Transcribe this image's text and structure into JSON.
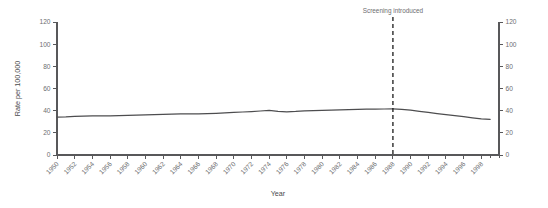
{
  "chart_data": {
    "type": "line",
    "title": "",
    "subtitle": "",
    "xlabel": "Year",
    "ylabel": "Rate per 100,000",
    "ylabel_right": "",
    "xlim": [
      1950,
      2000
    ],
    "ylim": [
      0,
      120
    ],
    "grid": false,
    "legend_position": "none",
    "y_ticks": [
      0,
      20,
      40,
      60,
      80,
      100,
      120
    ],
    "y_ticks_right": [
      0,
      20,
      40,
      60,
      80,
      100,
      120
    ],
    "x_ticks": [
      1950,
      1952,
      1954,
      1956,
      1958,
      1960,
      1962,
      1964,
      1966,
      1968,
      1970,
      1972,
      1974,
      1976,
      1978,
      1980,
      1982,
      1984,
      1986,
      1988,
      1990,
      1992,
      1994,
      1996,
      1998
    ],
    "x_tick_labels": [
      "1950",
      "1952",
      "1954",
      "1956",
      "1958",
      "1960",
      "1962",
      "1964",
      "1966",
      "1968",
      "1970",
      "1972",
      "1974",
      "1976",
      "1978",
      "1980",
      "1982",
      "1984",
      "1986",
      "1988",
      "1990",
      "1992",
      "1994",
      "1996",
      "1998"
    ],
    "annotations": [
      {
        "text": "Screening introduced",
        "x": 1988,
        "type": "vertical-dashed-line",
        "label_position": "top"
      }
    ],
    "series": [
      {
        "name": "Rate per 100,000",
        "color": "#4d4d4f",
        "x": [
          1950,
          1951,
          1952,
          1953,
          1954,
          1955,
          1956,
          1957,
          1958,
          1959,
          1960,
          1961,
          1962,
          1963,
          1964,
          1965,
          1966,
          1967,
          1968,
          1969,
          1970,
          1971,
          1972,
          1973,
          1974,
          1975,
          1976,
          1977,
          1978,
          1979,
          1980,
          1981,
          1982,
          1983,
          1984,
          1985,
          1986,
          1987,
          1988,
          1989,
          1990,
          1991,
          1992,
          1993,
          1994,
          1995,
          1996,
          1997,
          1998,
          1999
        ],
        "values": [
          34.2,
          34.3,
          34.8,
          35.1,
          35.3,
          35.2,
          35.4,
          35.6,
          35.8,
          36.0,
          36.2,
          36.4,
          36.6,
          36.8,
          37.0,
          37.1,
          37.0,
          37.3,
          37.6,
          38.0,
          38.4,
          38.8,
          39.2,
          39.7,
          40.2,
          39.4,
          39.0,
          39.3,
          39.8,
          40.1,
          40.3,
          40.5,
          40.7,
          40.9,
          41.1,
          41.3,
          41.4,
          41.5,
          41.6,
          41.2,
          40.4,
          39.4,
          38.4,
          37.4,
          36.4,
          35.5,
          34.6,
          33.6,
          32.6,
          32.2
        ]
      }
    ]
  },
  "geometry": {
    "plot_left": 57,
    "plot_right": 499,
    "plot_top": 22,
    "plot_bottom": 155
  }
}
